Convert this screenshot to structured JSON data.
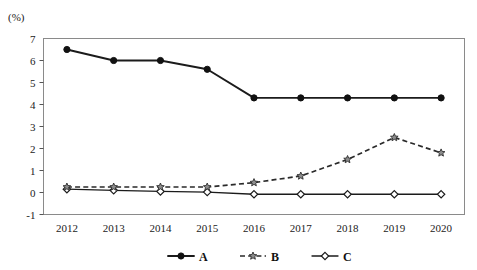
{
  "chart_data": {
    "type": "line",
    "title": "",
    "subtitle": "",
    "unit_label": "(%)",
    "xlabel": "",
    "ylabel": "",
    "categories": [
      "2012",
      "2013",
      "2014",
      "2015",
      "2016",
      "2017",
      "2018",
      "2019",
      "2020"
    ],
    "ylim": [
      -1,
      7
    ],
    "yticks": [
      "7",
      "6",
      "5",
      "4",
      "3",
      "2",
      "1",
      "0",
      "-1"
    ],
    "ytick_values": [
      7,
      6,
      5,
      4,
      3,
      2,
      1,
      0,
      -1
    ],
    "grid": false,
    "legend_position": "bottom",
    "series": [
      {
        "name": "A",
        "marker": "filled-circle",
        "linestyle": "solid",
        "color": "#111111",
        "values": [
          6.5,
          6.0,
          6.0,
          5.6,
          4.3,
          4.3,
          4.3,
          4.3,
          4.3
        ]
      },
      {
        "name": "B",
        "marker": "star",
        "linestyle": "dashed",
        "color": "#8d8d8d",
        "values": [
          0.25,
          0.25,
          0.25,
          0.25,
          0.45,
          0.75,
          1.5,
          2.5,
          1.8
        ]
      },
      {
        "name": "C",
        "marker": "open-diamond",
        "linestyle": "solid",
        "color": "#1b1b1b",
        "values": [
          0.15,
          0.1,
          0.05,
          0.02,
          -0.08,
          -0.08,
          -0.08,
          -0.08,
          -0.08
        ]
      }
    ]
  },
  "legend": {
    "items": [
      {
        "label": "A"
      },
      {
        "label": "B"
      },
      {
        "label": "C"
      }
    ]
  },
  "axis": {
    "unit": "(%)"
  }
}
